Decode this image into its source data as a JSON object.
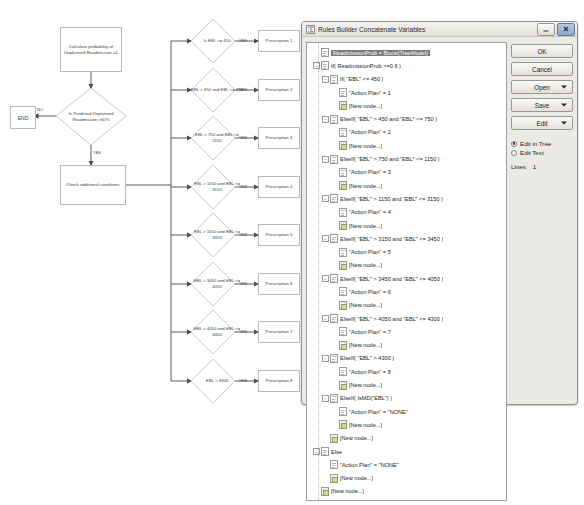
{
  "flowchart": {
    "start_box": "Calculate probability of Unplanned Readmission =1",
    "decision": "Is Predicted Unplanned Readmission >60%",
    "end_box": "END",
    "no_label": "NO",
    "yes_label": "YES",
    "check_box": "Check additional conditions",
    "branches": [
      {
        "condition": "Is EBL <= 450",
        "yes": "YES",
        "result": "Prescription 1"
      },
      {
        "condition": "EBL > 450 and EBL <= 750",
        "yes": "YES",
        "result": "Prescription 2"
      },
      {
        "condition": "EBL > 750 and EBL <= 1150",
        "yes": "YES",
        "result": "Prescription 3"
      },
      {
        "condition": "EBL > 1150 and EBL <= 3150",
        "yes": "YES",
        "result": "Prescription 4"
      },
      {
        "condition": "EBL > 3150 and EBL <= 3450",
        "yes": "YES",
        "result": "Prescription 5"
      },
      {
        "condition": "EBL > 3450 and EBL <= 4050",
        "yes": "YES",
        "result": "Prescription 6"
      },
      {
        "condition": "EBL > 4050 and EBL <= 4300",
        "yes": "YES",
        "result": "Prescription 7"
      },
      {
        "condition": "EBL > 4300",
        "yes": "YES",
        "result": "Prescription 8"
      }
    ]
  },
  "dialog": {
    "title": "Rules Builder Concatenate Variables",
    "title_icon": "formula-icon",
    "minimize_icon": "minimize-icon",
    "close_icon": "close-icon",
    "buttons": [
      {
        "label": "OK",
        "name": "ok-button",
        "split": false
      },
      {
        "label": "Cancel",
        "name": "cancel-button",
        "split": false
      },
      {
        "label": "Open",
        "name": "open-button",
        "split": true
      },
      {
        "label": "Save",
        "name": "save-button",
        "split": true
      },
      {
        "label": "Edit",
        "name": "edit-button",
        "split": true
      }
    ],
    "radios": [
      {
        "label": "Edit in Tree",
        "selected": true
      },
      {
        "label": "Edit Text",
        "selected": false
      }
    ],
    "lines_label": "Lines",
    "lines_value": "1",
    "tree": [
      {
        "depth": 0,
        "expander": "",
        "icon": "doc",
        "label": "ReadmissionProb = Boost(TreeModel)",
        "selected": true
      },
      {
        "depth": 0,
        "expander": "-",
        "icon": "rule",
        "label": "If( ReadmissionProb >=0.6 )",
        "selected": false
      },
      {
        "depth": 1,
        "expander": "-",
        "icon": "rule",
        "label": "If( \"EBL\" <= 450 )",
        "selected": false
      },
      {
        "depth": 2,
        "expander": "",
        "icon": "doc",
        "label": "\"Action Plan\" = 1",
        "selected": false
      },
      {
        "depth": 2,
        "expander": "",
        "icon": "new",
        "label": "[New node...]",
        "selected": false
      },
      {
        "depth": 1,
        "expander": "-",
        "icon": "rule",
        "label": "ElseIf( \"EBL\" > 450 and \"EBL\" <= 750 )",
        "selected": false
      },
      {
        "depth": 2,
        "expander": "",
        "icon": "doc",
        "label": "\"Action Plan\" = 2",
        "selected": false
      },
      {
        "depth": 2,
        "expander": "",
        "icon": "new",
        "label": "[New node...]",
        "selected": false
      },
      {
        "depth": 1,
        "expander": "-",
        "icon": "rule",
        "label": "ElseIf( \"EBL\" > 750 and \"EBL\" <= 1150 )",
        "selected": false
      },
      {
        "depth": 2,
        "expander": "",
        "icon": "doc",
        "label": "\"Action Plan\" = 3",
        "selected": false
      },
      {
        "depth": 2,
        "expander": "",
        "icon": "new",
        "label": "[New node...]",
        "selected": false
      },
      {
        "depth": 1,
        "expander": "-",
        "icon": "rule",
        "label": "ElseIf( \"EBL\" > 1150 and \"EBL\" <= 3150 )",
        "selected": false
      },
      {
        "depth": 2,
        "expander": "",
        "icon": "doc",
        "label": "\"Action Plan\" = 4",
        "selected": false
      },
      {
        "depth": 2,
        "expander": "",
        "icon": "new",
        "label": "[New node...]",
        "selected": false
      },
      {
        "depth": 1,
        "expander": "-",
        "icon": "rule",
        "label": "ElseIf( \"EBL\" > 3150 and \"EBL\" <= 3450 )",
        "selected": false
      },
      {
        "depth": 2,
        "expander": "",
        "icon": "doc",
        "label": "\"Action Plan\" = 5",
        "selected": false
      },
      {
        "depth": 2,
        "expander": "",
        "icon": "new",
        "label": "[New node...]",
        "selected": false
      },
      {
        "depth": 1,
        "expander": "-",
        "icon": "rule",
        "label": "ElseIf( \"EBL\" > 3450 and \"EBL\" <= 4050 )",
        "selected": false
      },
      {
        "depth": 2,
        "expander": "",
        "icon": "doc",
        "label": "\"Action Plan\" = 6",
        "selected": false
      },
      {
        "depth": 2,
        "expander": "",
        "icon": "new",
        "label": "[New node...]",
        "selected": false
      },
      {
        "depth": 1,
        "expander": "-",
        "icon": "rule",
        "label": "ElseIf( \"EBL\" > 4050 and \"EBL\" <= 4300 )",
        "selected": false
      },
      {
        "depth": 2,
        "expander": "",
        "icon": "doc",
        "label": "\"Action Plan\" = 7",
        "selected": false
      },
      {
        "depth": 2,
        "expander": "",
        "icon": "new",
        "label": "[New node...]",
        "selected": false
      },
      {
        "depth": 1,
        "expander": "-",
        "icon": "rule",
        "label": "ElseIf( \"EBL\" > 4300 )",
        "selected": false
      },
      {
        "depth": 2,
        "expander": "",
        "icon": "doc",
        "label": "\"Action Plan\" = 8",
        "selected": false
      },
      {
        "depth": 2,
        "expander": "",
        "icon": "new",
        "label": "[New node...]",
        "selected": false
      },
      {
        "depth": 1,
        "expander": "-",
        "icon": "rule",
        "label": "ElseIf( IsMD(\"EBL\") )",
        "selected": false
      },
      {
        "depth": 2,
        "expander": "",
        "icon": "doc",
        "label": "\"Action Plan\" = \"NONE\"",
        "selected": false
      },
      {
        "depth": 2,
        "expander": "",
        "icon": "new",
        "label": "[New node...]",
        "selected": false
      },
      {
        "depth": 1,
        "expander": "",
        "icon": "new",
        "label": "[New node...]",
        "selected": false
      },
      {
        "depth": 0,
        "expander": "-",
        "icon": "rule",
        "label": "Else",
        "selected": false
      },
      {
        "depth": 1,
        "expander": "",
        "icon": "doc",
        "label": "\"Action Plan\" = \"NONE\"",
        "selected": false
      },
      {
        "depth": 1,
        "expander": "",
        "icon": "new",
        "label": "[New node...]",
        "selected": false
      },
      {
        "depth": 0,
        "expander": "",
        "icon": "new",
        "label": "[New node...]",
        "selected": false
      }
    ]
  }
}
